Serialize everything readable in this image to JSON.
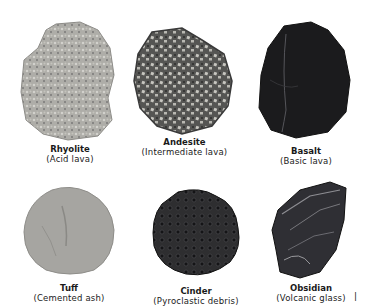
{
  "rocks": [
    {
      "name": "Rhyolite",
      "description": "(Acid lava)",
      "tone": "#a9a8a4"
    },
    {
      "name": "Andesite",
      "description": "(Intermediate lava)",
      "tone": "#6e6e6a"
    },
    {
      "name": "Basalt",
      "description": "(Basic lava)",
      "tone": "#1b1b1d"
    },
    {
      "name": "Tuff",
      "description": "(Cemented ash)",
      "tone": "#a3a29e"
    },
    {
      "name": "Cinder",
      "description": "(Pyroclastic debris)",
      "tone": "#2a2a2c"
    },
    {
      "name": "Obsidian",
      "description": "(Volcanic glass)",
      "tone": "#35353a"
    }
  ],
  "margin_mark": "|"
}
